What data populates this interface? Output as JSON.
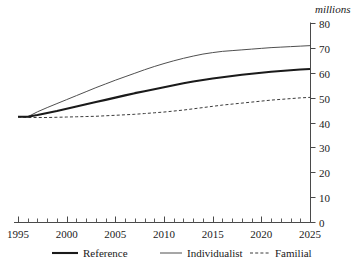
{
  "chart_data": {
    "type": "line",
    "title": "",
    "subtitle": "",
    "xlabel": "",
    "ylabel": "",
    "unit_label": "millions",
    "xlim": [
      1995,
      2025
    ],
    "ylim": [
      0,
      80
    ],
    "grid": false,
    "legend_position": "bottom",
    "x_tick_labels": [
      "1995",
      "2000",
      "2005",
      "2010",
      "2015",
      "2020",
      "2025"
    ],
    "x_major_ticks": [
      1995,
      2000,
      2005,
      2010,
      2015,
      2020,
      2025
    ],
    "x_minor_tick_step": 1,
    "y_tick_labels": [
      "0",
      "10",
      "20",
      "30",
      "40",
      "50",
      "60",
      "70",
      "80"
    ],
    "y_major_ticks": [
      0,
      10,
      20,
      30,
      40,
      50,
      60,
      70,
      80
    ],
    "y_axis_side": "right",
    "x": [
      1995,
      1996,
      1997,
      1998,
      1999,
      2000,
      2001,
      2002,
      2003,
      2004,
      2005,
      2006,
      2007,
      2008,
      2009,
      2010,
      2011,
      2012,
      2013,
      2014,
      2015,
      2016,
      2017,
      2018,
      2019,
      2020,
      2021,
      2022,
      2023,
      2024,
      2025
    ],
    "series": [
      {
        "name": "Reference",
        "style": "solid-thick",
        "color": "#1a1a1a",
        "width": 2.1,
        "values": [
          42.3,
          42.3,
          43.0,
          43.8,
          44.6,
          45.5,
          46.4,
          47.3,
          48.2,
          49.1,
          50.0,
          50.9,
          51.8,
          52.6,
          53.4,
          54.2,
          55.0,
          55.8,
          56.5,
          57.1,
          57.7,
          58.2,
          58.7,
          59.2,
          59.6,
          60.0,
          60.4,
          60.7,
          61.0,
          61.3,
          61.5
        ]
      },
      {
        "name": "Individualist",
        "style": "solid-thin",
        "color": "#4f4f4f",
        "width": 1.0,
        "values": [
          42.3,
          42.3,
          44.3,
          46.0,
          47.6,
          49.2,
          50.8,
          52.4,
          54.0,
          55.5,
          57.0,
          58.4,
          59.8,
          61.2,
          62.5,
          63.7,
          64.8,
          65.8,
          66.7,
          67.5,
          68.1,
          68.6,
          68.9,
          69.2,
          69.5,
          69.8,
          70.1,
          70.3,
          70.5,
          70.7,
          70.9
        ]
      },
      {
        "name": "Familial",
        "style": "dashed",
        "color": "#3a3a3a",
        "width": 1.0,
        "values": [
          42.3,
          42.0,
          42.0,
          42.0,
          42.1,
          42.2,
          42.3,
          42.4,
          42.5,
          42.7,
          42.9,
          43.1,
          43.3,
          43.6,
          43.9,
          44.2,
          44.6,
          45.0,
          45.5,
          46.0,
          46.5,
          47.0,
          47.4,
          47.8,
          48.2,
          48.6,
          49.0,
          49.3,
          49.6,
          49.9,
          50.1
        ]
      }
    ],
    "legend": [
      {
        "label": "Reference",
        "style": "solid-thick",
        "color": "#1a1a1a"
      },
      {
        "label": "Individualist",
        "style": "solid-thin",
        "color": "#4f4f4f"
      },
      {
        "label": "Familial",
        "style": "dashed",
        "color": "#3a3a3a"
      }
    ],
    "colors": {
      "background": "#ffffff",
      "axis": "#4a4a4a",
      "text": "#1a1a1a"
    }
  }
}
